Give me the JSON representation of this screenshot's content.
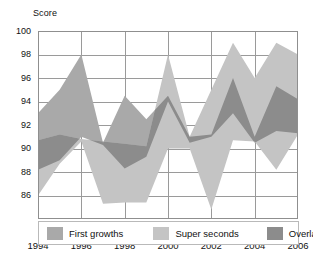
{
  "chart_data": {
    "type": "area",
    "title": "",
    "xlabel": "",
    "ylabel": "Score",
    "ylim": [
      84,
      100
    ],
    "xlim": [
      1994,
      2006
    ],
    "grid": true,
    "legend_position": "bottom-inside",
    "ytick_labels": [
      "100",
      "98",
      "96",
      "94",
      "92",
      "90",
      "88",
      "86"
    ],
    "ytick_values": [
      100,
      98,
      96,
      94,
      92,
      90,
      88,
      86
    ],
    "xtick_labels": [
      "1994",
      "1996",
      "1998",
      "2000",
      "2002",
      "2004",
      "2006"
    ],
    "xtick_values": [
      1994,
      1996,
      1998,
      2000,
      2002,
      2004,
      2006
    ],
    "x": [
      1994,
      1995,
      1996,
      1997,
      1998,
      1999,
      2000,
      2001,
      2002,
      2003,
      2004,
      2005,
      2006
    ],
    "series": [
      {
        "name": "First growths",
        "color": "#a9a9a9",
        "upper": [
          93.0,
          95.0,
          98.0,
          90.5,
          94.5,
          92.5,
          94.5,
          91.0,
          91.2,
          96.0,
          91.0,
          95.3,
          94.2
        ],
        "lower": [
          88.2,
          89.0,
          91.0,
          90.3,
          88.3,
          89.3,
          94.0,
          90.5,
          91.0,
          93.0,
          90.5,
          91.5,
          91.3
        ]
      },
      {
        "name": "Super seconds",
        "color": "#c4c4c4",
        "upper": [
          90.7,
          91.2,
          90.8,
          90.6,
          90.4,
          90.2,
          98.0,
          91.0,
          95.0,
          99.0,
          96.0,
          99.0,
          98.0
        ],
        "lower": [
          86.0,
          88.7,
          90.6,
          85.3,
          85.4,
          85.4,
          90.0,
          90.0,
          84.8,
          90.7,
          90.6,
          88.2,
          91.2
        ]
      }
    ],
    "overlap": {
      "name": "Overlap",
      "color": "#8c8c8c",
      "description": "Region where the First growths band and the Super seconds band intersect"
    },
    "legend": [
      {
        "label": "First growths",
        "color": "#a9a9a9"
      },
      {
        "label": "Super seconds",
        "color": "#c4c4c4"
      },
      {
        "label": "Overlap",
        "color": "#8c8c8c"
      }
    ],
    "style": {
      "grid_color": "#9a9a9a",
      "axis_color": "#8f8f8f",
      "background": "#ffffff"
    }
  }
}
